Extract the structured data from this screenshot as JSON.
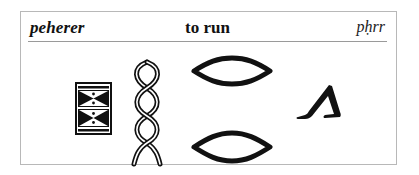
{
  "entry": {
    "word": "peherer",
    "meaning": "to run",
    "transliteration": "pḥrr"
  },
  "hieroglyphs": [
    {
      "name": "mat-box-glyph",
      "description": "rectangular box with two hourglass triangle panels and dots"
    },
    {
      "name": "twisted-flax-glyph",
      "description": "vertical twisted rope / braid"
    },
    {
      "name": "lozenge-glyph-top",
      "description": "horizontal diamond outline"
    },
    {
      "name": "lozenge-glyph-bottom",
      "description": "horizontal diamond outline"
    },
    {
      "name": "walking-legs-glyph",
      "description": "pair of walking legs"
    }
  ],
  "colors": {
    "ink": "#111111",
    "frame": "#b8b8b8",
    "rule": "#9a9a9a",
    "background": "#ffffff"
  }
}
